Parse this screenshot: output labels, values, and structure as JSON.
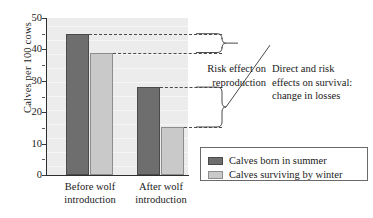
{
  "chart_data": {
    "type": "bar",
    "title": "",
    "xlabel": "",
    "ylabel": "Calves per 100 cows",
    "ylim": [
      0,
      50
    ],
    "yticks": [
      0,
      10,
      20,
      30,
      40,
      50
    ],
    "ytick_labels": [
      "0",
      "10",
      "20",
      "30",
      "40",
      "50"
    ],
    "grid": false,
    "legend_position": "bottom-right",
    "categories": [
      "Before wolf introduction",
      "After wolf introduction"
    ],
    "category_lines": [
      [
        "Before wolf",
        "introduction"
      ],
      [
        "After wolf",
        "introduction"
      ]
    ],
    "series": [
      {
        "name": "Calves born in summer",
        "color": "#6e6e6e",
        "values": [
          45,
          28
        ]
      },
      {
        "name": "Calves surviving by winter",
        "color": "#c9c9c9",
        "values": [
          39,
          15.3
        ]
      }
    ],
    "annotations": [
      {
        "id": "risk-reproduction",
        "text": "Risk effect on reproduction",
        "lines": [
          "Risk effect on",
          "reproduction"
        ],
        "brace_from_value": 45,
        "brace_to_value": 39
      },
      {
        "id": "survival-losses",
        "text": "Direct and risk effects on survival: change in losses",
        "lines": [
          "Direct and risk",
          "effects on survival:",
          "change in losses"
        ],
        "brace_from_value": 28,
        "brace_to_value": 15.3
      }
    ]
  },
  "axis": {
    "y_label": "Calves per 100 cows",
    "y_tick_0": "0",
    "y_tick_10": "10",
    "y_tick_20": "20",
    "y_tick_30": "30",
    "y_tick_40": "40",
    "y_tick_50": "50"
  },
  "xaxis": {
    "cat1_line1": "Before wolf",
    "cat1_line2": "introduction",
    "cat2_line1": "After wolf",
    "cat2_line2": "introduction"
  },
  "annotations": {
    "risk_line1": "Risk effect on",
    "risk_line2": "reproduction",
    "survival_line1": "Direct and risk",
    "survival_line2": "effects on survival:",
    "survival_line3": "change in losses"
  },
  "legend": {
    "item1": "Calves born in summer",
    "item2": "Calves surviving by winter"
  }
}
